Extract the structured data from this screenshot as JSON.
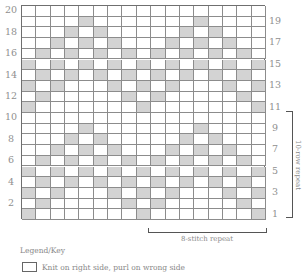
{
  "chart_data": {
    "type": "table",
    "columns": 17,
    "rows": 20,
    "shaded_color": "#d3d3d3",
    "blank_color": "#ffffff",
    "shaded_cells_by_row": {
      "1": [
        1,
        9,
        17
      ],
      "2": [
        2,
        8,
        10,
        16
      ],
      "3": [
        1,
        3,
        7,
        9,
        11,
        15,
        17
      ],
      "4": [
        2,
        4,
        6,
        8,
        10,
        12,
        14,
        16
      ],
      "5": [
        1,
        3,
        5,
        7,
        9,
        11,
        13,
        15,
        17
      ],
      "6": [
        2,
        4,
        6,
        8,
        10,
        12,
        14,
        16
      ],
      "7": [
        3,
        5,
        7,
        11,
        13,
        15
      ],
      "8": [
        4,
        6,
        12,
        14
      ],
      "9": [
        5,
        13
      ],
      "10": [],
      "11": [
        1,
        9,
        17
      ],
      "12": [
        2,
        8,
        10,
        16
      ],
      "13": [
        1,
        3,
        7,
        9,
        11,
        15,
        17
      ],
      "14": [
        2,
        4,
        6,
        8,
        10,
        12,
        14,
        16
      ],
      "15": [
        1,
        3,
        5,
        7,
        9,
        11,
        13,
        15,
        17
      ],
      "16": [
        2,
        4,
        6,
        8,
        10,
        12,
        14,
        16
      ],
      "17": [
        3,
        5,
        7,
        11,
        13,
        15
      ],
      "18": [
        4,
        6,
        12,
        14
      ],
      "19": [
        5,
        13
      ],
      "20": []
    },
    "left_row_labels": [
      "2",
      "4",
      "6",
      "8",
      "10",
      "12",
      "14",
      "16",
      "18",
      "20"
    ],
    "right_row_labels": [
      "1",
      "3",
      "5",
      "7",
      "9",
      "11",
      "13",
      "15",
      "17",
      "19"
    ],
    "annotations": {
      "row_repeat": "10-row repeat",
      "stitch_repeat": "8-stitch repeat"
    }
  },
  "legend": {
    "title": "Legend/Key",
    "items": [
      {
        "symbol": "blank-square",
        "label": "Knit on right side, purl on wrong side"
      }
    ]
  }
}
